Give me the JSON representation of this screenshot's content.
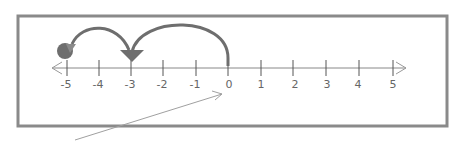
{
  "diagram": {
    "type": "number-line",
    "ticks": [
      "-5",
      "-4",
      "-3",
      "-2",
      "-1",
      "0",
      "1",
      "2",
      "3",
      "4",
      "5"
    ],
    "jumps": [
      {
        "from": 0,
        "to": -3,
        "label": "jump-1"
      },
      {
        "from": -3,
        "to": -5,
        "label": "jump-2"
      }
    ],
    "start": 0,
    "end": -5,
    "colors": {
      "frame": "#8a8a8a",
      "arc": "#6e6e6e",
      "axis": "#888888",
      "pointer": "#999999"
    }
  }
}
